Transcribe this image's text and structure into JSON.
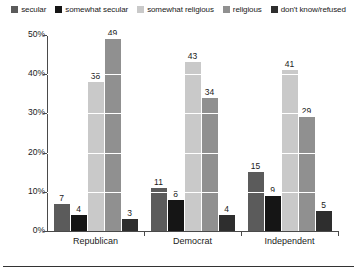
{
  "chart_data": {
    "type": "bar",
    "title": "",
    "subtitle": "",
    "xlabel": "",
    "ylabel": "",
    "ylim": [
      0,
      50
    ],
    "yticks": [
      0,
      10,
      20,
      30,
      40,
      50
    ],
    "ytick_labels": [
      "0%",
      "10%",
      "20%",
      "30%",
      "40%",
      "50%"
    ],
    "grid": true,
    "grid_color": "#ffffff",
    "legend_position": "top-center",
    "value_labels": true,
    "categories": [
      "Republican",
      "Democrat",
      "Independent"
    ],
    "series": [
      {
        "name": "secular",
        "color": "#5b5b5b",
        "values": [
          7,
          11,
          15
        ]
      },
      {
        "name": "somewhat secular",
        "color": "#151515",
        "values": [
          4,
          8,
          9
        ]
      },
      {
        "name": "somewhat religious",
        "color": "#c9c9c9",
        "values": [
          38,
          43,
          41
        ]
      },
      {
        "name": "religious",
        "color": "#909090",
        "values": [
          49,
          34,
          29
        ]
      },
      {
        "name": "don't know/refused",
        "color": "#2e2e2e",
        "values": [
          3,
          4,
          5
        ]
      }
    ]
  },
  "legend": {
    "items": [
      {
        "label": "secular",
        "swatch_color": "#5b5b5b"
      },
      {
        "label": "somewhat secular",
        "swatch_color": "#151515"
      },
      {
        "label": "somewhat religious",
        "swatch_color": "#c9c9c9"
      },
      {
        "label": "religious",
        "swatch_color": "#909090"
      },
      {
        "label": "don't know/refused",
        "swatch_color": "#2e2e2e"
      }
    ]
  },
  "axes": {
    "y_tick_labels": [
      "50%",
      "40%",
      "30%",
      "20%",
      "10%",
      "0%"
    ],
    "x_tick_labels": [
      "Republican",
      "Democrat",
      "Independent"
    ]
  }
}
